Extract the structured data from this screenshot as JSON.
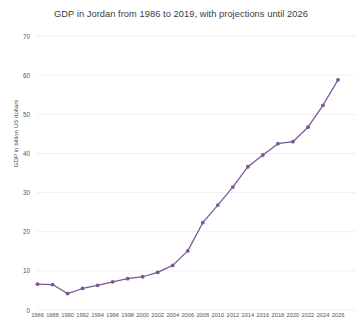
{
  "chart_data": {
    "type": "line",
    "title": "GDP in Jordan from 1986 to 2019, with projections until 2026",
    "xlabel": "",
    "ylabel": "GDP in billion US dollars",
    "ylim": [
      0,
      70
    ],
    "ytick_labels": [
      "70",
      "60",
      "50",
      "40",
      "30",
      "20",
      "10",
      "0"
    ],
    "yticks": [
      70,
      60,
      50,
      40,
      30,
      20,
      10,
      0
    ],
    "grid": true,
    "legend": "none",
    "line_color": "#7a5795",
    "marker": "circle",
    "categories": [
      "1986",
      "1988",
      "1990",
      "1992",
      "1994",
      "1996",
      "1998",
      "2000",
      "2002",
      "2004",
      "2006",
      "2008",
      "2010",
      "2012",
      "2014",
      "2016",
      "2018",
      "2020",
      "2022",
      "2024",
      "2026"
    ],
    "x": [
      1986,
      1988,
      1990,
      1992,
      1994,
      1996,
      1998,
      2000,
      2002,
      2004,
      2006,
      2008,
      2010,
      2012,
      2014,
      2016,
      2018,
      2020,
      2022,
      2024,
      2026
    ],
    "values": [
      6.6,
      6.5,
      4.2,
      5.5,
      6.3,
      7.2,
      8.0,
      8.5,
      9.6,
      11.4,
      15.1,
      22.3,
      26.8,
      31.4,
      36.6,
      39.6,
      42.5,
      43.0,
      46.7,
      52.3,
      58.8
    ],
    "series": [
      {
        "name": "GDP in billion US dollars",
        "values": [
          6.6,
          6.5,
          4.2,
          5.5,
          6.3,
          7.2,
          8.0,
          8.5,
          9.6,
          11.4,
          15.1,
          22.3,
          26.8,
          31.4,
          36.6,
          39.6,
          42.5,
          43.0,
          46.7,
          52.3,
          58.8
        ]
      }
    ]
  }
}
